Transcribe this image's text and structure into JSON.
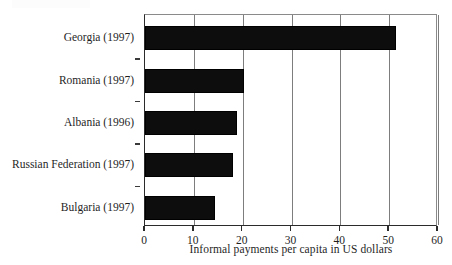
{
  "figure": {
    "artifact_text": "",
    "background": "#ffffff",
    "bar_color": "#0d0d0d",
    "grid_color": "#7d7d7d",
    "axis_color": "#2b2b2b"
  },
  "chart_data": {
    "type": "bar",
    "orientation": "horizontal",
    "title": "",
    "xlabel": "Informal payments per capita in US dollars",
    "ylabel": "",
    "xlim": [
      0,
      60
    ],
    "xticks": [
      0,
      10,
      20,
      30,
      40,
      50,
      60
    ],
    "xtick_labels": [
      "0",
      "10",
      "20",
      "30",
      "40",
      "50",
      "60"
    ],
    "grid": "vertical",
    "legend": "none",
    "categories": [
      "Georgia (1997)",
      "Romania (1997)",
      "Albania (1996)",
      "Russian Federation (1997)",
      "Bulgaria (1997)"
    ],
    "values": [
      51.3,
      20.2,
      18.9,
      18.0,
      14.3
    ],
    "series": [
      {
        "name": "Informal payments per capita in US dollars",
        "values": [
          51.3,
          20.2,
          18.9,
          18.0,
          14.3
        ]
      }
    ]
  }
}
